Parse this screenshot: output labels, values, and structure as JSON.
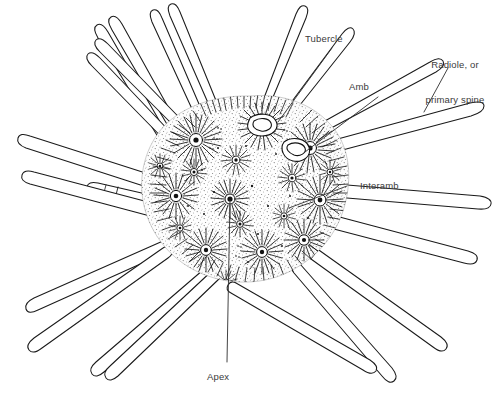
{
  "figure": {
    "background_color": "#ffffff",
    "ink_color": "#1a1a1a",
    "label_color": "#3a3a3a",
    "width": 499,
    "height": 395
  },
  "labels": {
    "tubercle": "Tubercle",
    "amb": "Amb",
    "radiole_line1": "Radiole, or",
    "radiole_line2": "primary spine",
    "interamb": "Interamb",
    "apex": "Apex"
  }
}
